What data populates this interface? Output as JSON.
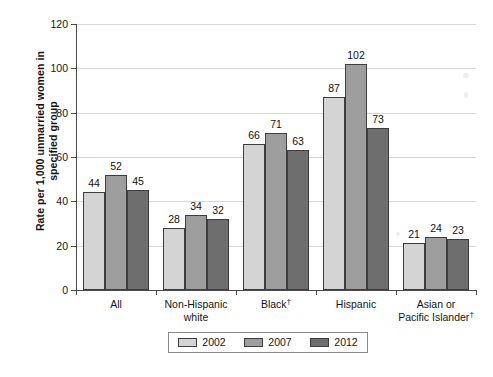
{
  "chart_data": {
    "type": "bar",
    "title": "",
    "xlabel": "",
    "ylabel": "Rate per 1,000 unmarried women in\nspecified group",
    "ylim": [
      0,
      120
    ],
    "yticks": [
      0,
      20,
      40,
      60,
      80,
      100,
      120
    ],
    "ytick_labels": [
      "0",
      "20",
      "40",
      "60",
      "80",
      "100",
      "120"
    ],
    "grid": true,
    "legend_position": "bottom",
    "categories": [
      "All",
      "Non-Hispanic\nwhite",
      "Black†",
      "Hispanic",
      "Asian or\nPacific Islander†"
    ],
    "category_plain": [
      "All",
      "Non-Hispanic white",
      "Black",
      "Hispanic",
      "Asian or Pacific Islander"
    ],
    "series": [
      {
        "name": "2002",
        "color": "#d4d4d4",
        "values": [
          44,
          28,
          66,
          87,
          21
        ]
      },
      {
        "name": "2007",
        "color": "#9e9e9e",
        "values": [
          52,
          34,
          71,
          102,
          24
        ]
      },
      {
        "name": "2012",
        "color": "#6e6e6e",
        "values": [
          45,
          32,
          63,
          73,
          23
        ]
      }
    ]
  },
  "axis": {
    "y_title": "Rate per 1,000 unmarried women in\nspecified group",
    "ytick_labels": [
      "120",
      "100",
      "80",
      "60",
      "40",
      "20",
      "0"
    ]
  },
  "categories": [
    {
      "label": "All",
      "line1": "All",
      "line2": "",
      "dagger": false
    },
    {
      "label": "Non-Hispanic white",
      "line1": "Non-Hispanic",
      "line2": "white",
      "dagger": false
    },
    {
      "label": "Black",
      "line1": "Black",
      "line2": "",
      "dagger": true
    },
    {
      "label": "Hispanic",
      "line1": "Hispanic",
      "line2": "",
      "dagger": false
    },
    {
      "label": "Asian or Pacific Islander",
      "line1": "Asian or",
      "line2": "Pacific Islander",
      "dagger": true
    }
  ],
  "legend": {
    "entries": [
      {
        "label": "2002",
        "color": "#d4d4d4"
      },
      {
        "label": "2007",
        "color": "#9e9e9e"
      },
      {
        "label": "2012",
        "color": "#6e6e6e"
      }
    ]
  },
  "bar_values": {
    "all": {
      "y2002": "44",
      "y2007": "52",
      "y2012": "45"
    },
    "non_hispanic_white": {
      "y2002": "28",
      "y2007": "34",
      "y2012": "32"
    },
    "black": {
      "y2002": "66",
      "y2007": "71",
      "y2012": "63"
    },
    "hispanic": {
      "y2002": "87",
      "y2007": "102",
      "y2012": "73"
    },
    "asian_pacific_islander": {
      "y2002": "21",
      "y2007": "24",
      "y2012": "23"
    }
  },
  "caption": ""
}
